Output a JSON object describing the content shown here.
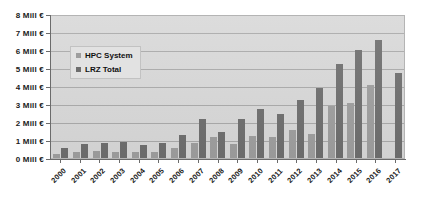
{
  "chart_data": {
    "type": "bar",
    "title": "",
    "xlabel": "",
    "ylabel": "",
    "ylim": [
      0,
      8
    ],
    "ytick_step": 1,
    "grid": true,
    "legend_position": "inside-upper-left",
    "categories": [
      "2000",
      "2001",
      "2002",
      "2003",
      "2004",
      "2005",
      "2006",
      "2007",
      "2008",
      "2009",
      "2010",
      "2011",
      "2012",
      "2013",
      "2014",
      "2015",
      "2016",
      "2017"
    ],
    "ytick_labels": [
      "0 Mill €",
      "1 Mill €",
      "2 Mill €",
      "3 Mill €",
      "4 Mill €",
      "5 Mill €",
      "6 Mill €",
      "7 Mill €",
      "8 Mill €"
    ],
    "series": [
      {
        "name": "HPC System",
        "color": "#9e9e9e",
        "values": [
          0.25,
          0.35,
          0.4,
          0.35,
          0.35,
          0.35,
          0.55,
          0.85,
          1.15,
          0.8,
          1.25,
          1.15,
          1.55,
          1.35,
          2.9,
          3.05,
          4.05,
          0.0
        ]
      },
      {
        "name": "LRZ Total",
        "color": "#6e6e6e",
        "values": [
          0.55,
          0.8,
          0.85,
          0.9,
          0.75,
          0.85,
          1.3,
          2.15,
          1.45,
          2.15,
          2.75,
          2.45,
          3.2,
          3.9,
          5.2,
          6.0,
          6.55,
          4.7
        ]
      }
    ]
  },
  "legend": {
    "items": [
      {
        "label": "HPC System"
      },
      {
        "label": "LRZ Total"
      }
    ]
  }
}
